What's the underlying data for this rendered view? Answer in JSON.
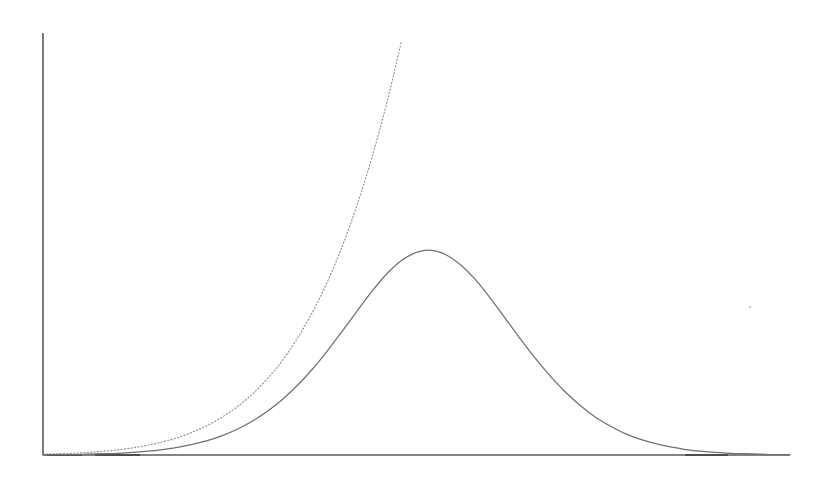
{
  "figure": {
    "width": 831,
    "height": 483,
    "background_color": "#ffffff",
    "description": "Faded scanned line plot with two unlabeled curves on bare axes"
  },
  "axes": {
    "origin": {
      "x": 43,
      "y": 455
    },
    "y_axis_top": {
      "x": 43,
      "y": 33
    },
    "x_axis_right": {
      "x": 790,
      "y": 455
    },
    "y_axis_color": "#5b5b5b",
    "x_axis_color": "#5b5b5b",
    "ticks_visible": "none",
    "tick_labels_visible": "none",
    "grid_visible": "none",
    "axis_titles_visible": "none"
  },
  "chart_data": {
    "type": "line",
    "title": "",
    "subtitle": "",
    "xlabel": "",
    "ylabel": "",
    "grid": false,
    "legend": "none",
    "xlim": [
      0,
      100
    ],
    "ylim": [
      0,
      100
    ],
    "x": [
      0,
      2,
      4,
      6,
      8,
      10,
      12,
      14,
      16,
      18,
      20,
      22,
      24,
      26,
      28,
      30,
      32,
      34,
      36,
      38,
      40,
      42,
      44,
      46,
      48,
      50,
      52,
      54,
      56,
      58,
      60,
      62,
      64,
      66,
      68,
      70,
      72,
      74,
      76,
      78,
      80,
      82,
      84,
      86,
      88,
      90,
      92,
      94,
      96,
      98,
      100
    ],
    "series": [
      {
        "name": "gaussian-curve",
        "style": "solid",
        "color": "#6f6f6f",
        "peak_x": 47.8,
        "peak_y": 48.5,
        "values": [
          0.0,
          0.1,
          0.1,
          0.2,
          0.3,
          0.4,
          0.6,
          0.9,
          1.3,
          1.8,
          2.5,
          3.4,
          4.6,
          6.1,
          8.0,
          10.3,
          13.1,
          16.4,
          20.2,
          24.5,
          29.2,
          34.0,
          38.7,
          42.9,
          46.1,
          48.0,
          48.5,
          47.4,
          44.9,
          41.3,
          36.9,
          32.1,
          27.3,
          22.7,
          18.5,
          14.8,
          11.6,
          8.9,
          6.8,
          5.0,
          3.7,
          2.7,
          1.9,
          1.3,
          0.9,
          0.6,
          0.4,
          0.3,
          0.2,
          0.1,
          0.1
        ]
      },
      {
        "name": "exponential-curve",
        "style": "dotted",
        "color": "#8d8d94",
        "x_end": 55.1,
        "y_end": 100.0,
        "values": [
          0.2,
          0.3,
          0.4,
          0.6,
          0.9,
          1.2,
          1.7,
          2.3,
          3.1,
          4.1,
          5.4,
          7.0,
          9.0,
          11.4,
          14.4,
          18.0,
          22.3,
          27.5,
          33.6,
          40.8,
          49.2,
          59.0,
          70.3,
          83.3,
          98.1,
          null,
          null,
          null,
          null,
          null,
          null,
          null,
          null,
          null,
          null,
          null,
          null,
          null,
          null,
          null,
          null,
          null,
          null,
          null,
          null,
          null,
          null,
          null,
          null,
          null,
          null
        ]
      }
    ],
    "annotations": []
  },
  "artifacts": {
    "baseline_smudges": [
      {
        "x_start": 47,
        "x_end": 82,
        "y": 455
      },
      {
        "x_start": 95,
        "x_end": 140,
        "y": 455
      },
      {
        "x_start": 685,
        "x_end": 728,
        "y": 455
      }
    ],
    "scan_speck": {
      "x": 749,
      "y": 306
    }
  }
}
